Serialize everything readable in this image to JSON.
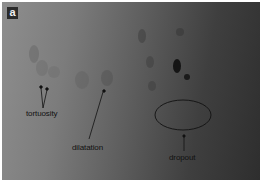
{
  "figure": {
    "panel_label": "a",
    "annotations": [
      {
        "id": "tortuosity",
        "text": "tortuosity"
      },
      {
        "id": "dilatation",
        "text": "dilatation"
      },
      {
        "id": "dropout",
        "text": "dropout"
      }
    ]
  },
  "colors": {
    "photo_left": "#8e8e8e",
    "photo_right": "#2e2e2e",
    "annotation": "#111111",
    "background": "#ffffff"
  }
}
